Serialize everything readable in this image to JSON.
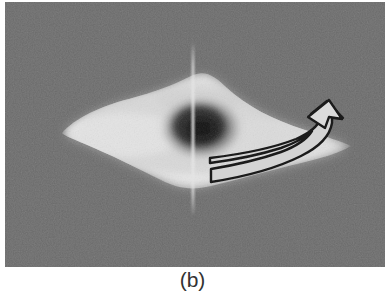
{
  "figure": {
    "caption": "(b)",
    "panel_label": "b",
    "background_color": "#6b6b6b",
    "page_background": "#ffffff",
    "panel_geometry": {
      "x": 5,
      "y": 2,
      "width": 380,
      "height": 265
    }
  },
  "image_content": {
    "modality": "grayscale scan",
    "description": "Lens / diamond shaped bright lobe with dark central core on a noisy mid-gray background, crossed by a faint vertical reference line, annotated with a curved outlined arrow at the right.",
    "blob": {
      "name": "bright-lobe",
      "left_tip_x": 62,
      "right_tip_x": 345,
      "top_y": 76,
      "bottom_y": 188,
      "highlight_color": "#f2f2f2",
      "core_color": "#1f1f1f",
      "core_center_x": 196,
      "core_center_y": 126
    },
    "crosshair": {
      "name": "vertical-reference-line",
      "x": 193,
      "top_y": 42,
      "bottom_y": 216,
      "color": "#e8e8e8"
    },
    "arrow": {
      "name": "curved-annotation-arrow",
      "fill_color": "#d8d8d8",
      "outline_color": "#141414",
      "tail_x": 212,
      "tail_y": 166,
      "head_x": 312,
      "head_y": 128,
      "direction": "counter-clockwise hook pointing up-left"
    }
  }
}
